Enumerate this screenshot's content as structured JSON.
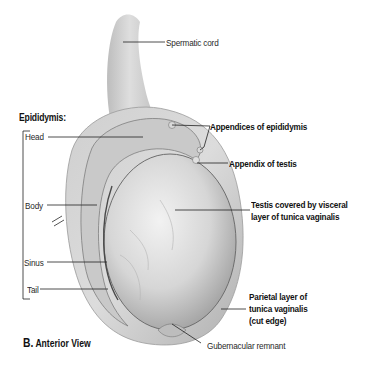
{
  "figure": {
    "caption_letter": "B.",
    "caption_text": "Anterior View",
    "group_heading": "Epididymis:"
  },
  "labels": {
    "spermatic_cord": "Spermatic cord",
    "head": "Head",
    "body": "Body",
    "sinus": "Sinus",
    "tail": "Tail",
    "appendices_epididymis": "Appendices of epididymis",
    "appendix_testis": "Appendix of testis",
    "testis_line1": "Testis covered by visceral",
    "testis_line2": "layer of tunica vaginalis",
    "parietal_line1": "Parietal layer of",
    "parietal_line2": "tunica vaginalis",
    "parietal_line3": "(cut edge)",
    "gubernacular": "Gubernacular remnant"
  },
  "colors": {
    "background": "#ffffff",
    "tissue_light": "#e4e4e4",
    "tissue_mid": "#c4c4c4",
    "tissue_dark": "#8a8a8a",
    "leader_line": "#222222",
    "text": "#1a1a1a"
  }
}
